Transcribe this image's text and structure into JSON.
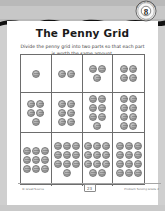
{
  "worksheet": {
    "title": "The Penny Grid",
    "instructions": "Divide the penny grid into two parts so that each part is worth the same amount.",
    "badge": {
      "number": "8",
      "arc_top": "Problem Solving",
      "arc_bottom": "Lesson"
    }
  },
  "grid": {
    "rows": 3,
    "cols": 4,
    "cells": [
      {
        "count": 1,
        "columns": 1,
        "label": "1 penny"
      },
      {
        "count": 2,
        "columns": 2,
        "label": "2 pennies"
      },
      {
        "count": 3,
        "columns": 2,
        "label": "3 pennies"
      },
      {
        "count": 4,
        "columns": 2,
        "label": "4 pennies"
      },
      {
        "count": 5,
        "columns": 2,
        "label": "5 pennies"
      },
      {
        "count": 6,
        "columns": 2,
        "label": "6 pennies"
      },
      {
        "count": 7,
        "columns": 2,
        "label": "7 pennies"
      },
      {
        "count": 8,
        "columns": 2,
        "label": "8 pennies"
      },
      {
        "count": 9,
        "columns": 3,
        "label": "9 pennies"
      },
      {
        "count": 10,
        "columns": 3,
        "label": "10 pennies"
      },
      {
        "count": 11,
        "columns": 3,
        "label": "11 pennies"
      },
      {
        "count": 12,
        "columns": 3,
        "label": "12 pennies"
      }
    ]
  },
  "footer": {
    "left": "© Great Source",
    "page": "23",
    "right": "Problem Solving Grade 2"
  },
  "colors": {
    "band": "#b9b9b9",
    "rule": "#6d6d6d",
    "penny": "#a8a8a8",
    "text": "#1a1a1a"
  }
}
